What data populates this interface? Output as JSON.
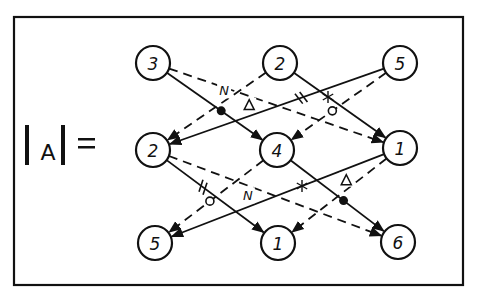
{
  "title": {
    "lhs_bar_left": "|",
    "lhs_symbol": "A",
    "lhs_bar_right": "|",
    "equals": "="
  },
  "nodes": [
    {
      "id": "t1",
      "row": "top",
      "col": 1,
      "label": "3",
      "x": 153,
      "y": 63
    },
    {
      "id": "t2",
      "row": "top",
      "col": 2,
      "label": "2",
      "x": 280,
      "y": 63
    },
    {
      "id": "t3",
      "row": "top",
      "col": 3,
      "label": "5",
      "x": 400,
      "y": 63
    },
    {
      "id": "m1",
      "row": "middle",
      "col": 1,
      "label": "2",
      "x": 153,
      "y": 150
    },
    {
      "id": "m2",
      "row": "middle",
      "col": 2,
      "label": "4",
      "x": 277,
      "y": 150
    },
    {
      "id": "m3",
      "row": "middle",
      "col": 3,
      "label": "1",
      "x": 400,
      "y": 148
    },
    {
      "id": "b1",
      "row": "bottom",
      "col": 1,
      "label": "5",
      "x": 155,
      "y": 243
    },
    {
      "id": "b2",
      "row": "bottom",
      "col": 2,
      "label": "1",
      "x": 278,
      "y": 243
    },
    {
      "id": "b3",
      "row": "bottom",
      "col": 3,
      "label": "6",
      "x": 398,
      "y": 242
    }
  ],
  "edges": [
    {
      "from": "t1",
      "to": "m2",
      "style": "solid",
      "mark": "filled-dot"
    },
    {
      "from": "t1",
      "to": "m3",
      "style": "dashed",
      "mark": "triangle",
      "mark_label": "Δ"
    },
    {
      "from": "t2",
      "to": "m1",
      "style": "dashed",
      "mark": "N",
      "mark_label": "N"
    },
    {
      "from": "t2",
      "to": "m3",
      "style": "solid",
      "mark": "asterisk",
      "mark_label": "✱"
    },
    {
      "from": "t3",
      "to": "m1",
      "style": "solid",
      "mark": "double-slash",
      "mark_label": "//"
    },
    {
      "from": "t3",
      "to": "m2",
      "style": "dashed",
      "mark": "open-circle"
    },
    {
      "from": "m1",
      "to": "b2",
      "style": "solid",
      "mark": "double-slash",
      "mark_label": "//"
    },
    {
      "from": "m1",
      "to": "b3",
      "style": "dashed",
      "mark": "N",
      "mark_label": "N"
    },
    {
      "from": "m2",
      "to": "b1",
      "style": "dashed",
      "mark": "open-circle"
    },
    {
      "from": "m2",
      "to": "b3",
      "style": "solid",
      "mark": "filled-dot"
    },
    {
      "from": "m3",
      "to": "b1",
      "style": "solid",
      "mark": "asterisk",
      "mark_label": "✱"
    },
    {
      "from": "m3",
      "to": "b2",
      "style": "dashed",
      "mark": "triangle",
      "mark_label": "Δ"
    }
  ],
  "colors": {
    "ink": "#111111",
    "paper": "#ffffff"
  }
}
